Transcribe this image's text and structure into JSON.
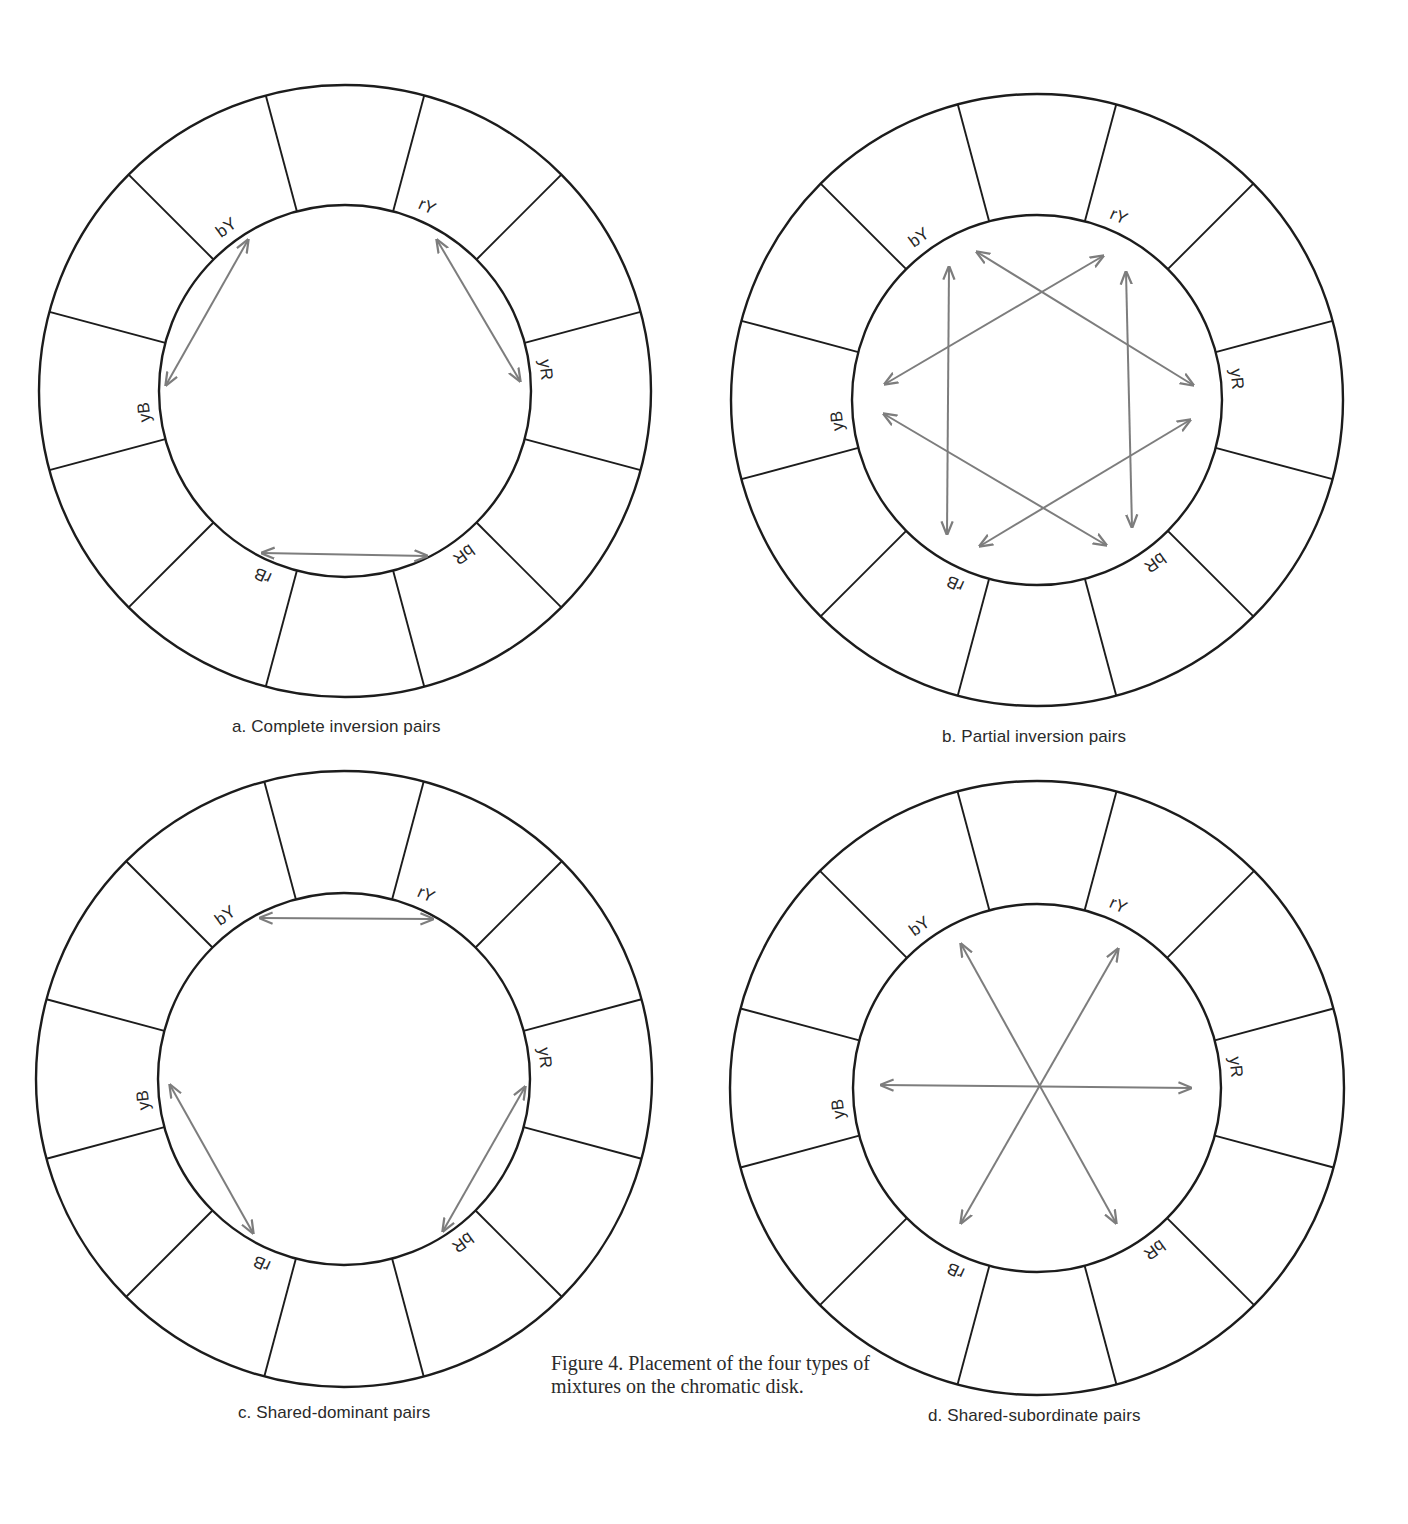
{
  "figure_caption": "Figure 4. Placement of the four types of mixtures on the chromatic disk.",
  "colors": {
    "ink": "#1c1c1c",
    "arrow": "#7d7d7d",
    "background": "#ffffff"
  },
  "segment_count": 12,
  "spoke_start_angle_deg": 15,
  "labels": [
    {
      "text": "yR",
      "angle": -6
    },
    {
      "text": "rY",
      "angle": -66
    },
    {
      "text": "bY",
      "angle": -126
    },
    {
      "text": "yB",
      "angle": 174
    },
    {
      "text": "rB",
      "angle": 114
    },
    {
      "text": "bR",
      "angle": 54
    }
  ],
  "disks": [
    {
      "id": "a",
      "caption": "a. Complete inversion pairs",
      "caption_pos": {
        "x": 232,
        "y": 717
      },
      "cx": 345,
      "cy": 391,
      "r_outer": 306,
      "r_inner": 186,
      "label_r": 202,
      "arrows": [
        {
          "x1": 248,
          "y1": 240,
          "x2": 166,
          "y2": 385
        },
        {
          "x1": 437,
          "y1": 240,
          "x2": 520,
          "y2": 381
        },
        {
          "x1": 262,
          "y1": 553,
          "x2": 427,
          "y2": 556
        }
      ]
    },
    {
      "id": "b",
      "caption": "b. Partial inversion pairs",
      "caption_pos": {
        "x": 942,
        "y": 727
      },
      "cx": 1037,
      "cy": 400,
      "r_outer": 306,
      "r_inner": 185,
      "label_r": 201,
      "arrows": [
        {
          "x1": 949,
          "y1": 267,
          "x2": 947,
          "y2": 534
        },
        {
          "x1": 1126,
          "y1": 272,
          "x2": 1132,
          "y2": 527
        },
        {
          "x1": 977,
          "y1": 252,
          "x2": 1193,
          "y2": 385
        },
        {
          "x1": 1103,
          "y1": 256,
          "x2": 885,
          "y2": 384
        },
        {
          "x1": 884,
          "y1": 414,
          "x2": 1106,
          "y2": 545
        },
        {
          "x1": 980,
          "y1": 546,
          "x2": 1190,
          "y2": 420
        }
      ]
    },
    {
      "id": "c",
      "caption": "c. Shared-dominant pairs",
      "caption_pos": {
        "x": 238,
        "y": 1403
      },
      "cx": 344,
      "cy": 1079,
      "r_outer": 308,
      "r_inner": 186,
      "label_r": 202,
      "arrows": [
        {
          "x1": 260,
          "y1": 918,
          "x2": 433,
          "y2": 919
        },
        {
          "x1": 170,
          "y1": 1085,
          "x2": 253,
          "y2": 1233
        },
        {
          "x1": 525,
          "y1": 1087,
          "x2": 443,
          "y2": 1231
        }
      ]
    },
    {
      "id": "d",
      "caption": "d. Shared-subordinate pairs",
      "caption_pos": {
        "x": 928,
        "y": 1406
      },
      "cx": 1037,
      "cy": 1088,
      "r_outer": 307,
      "r_inner": 184,
      "label_r": 200,
      "arrows": [
        {
          "x1": 881,
          "y1": 1085,
          "x2": 1191,
          "y2": 1088
        },
        {
          "x1": 961,
          "y1": 944,
          "x2": 1116,
          "y2": 1223
        },
        {
          "x1": 1118,
          "y1": 949,
          "x2": 961,
          "y2": 1223
        }
      ]
    }
  ]
}
